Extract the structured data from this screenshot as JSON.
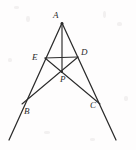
{
  "figure": {
    "background_color": "#fefdfd",
    "stroke_color": "#2b2b2b",
    "label_color": "#2b2b2b",
    "width": 136,
    "height": 150
  },
  "points": {
    "A": {
      "label": "A",
      "x": 62,
      "y": 23,
      "label_x": 53,
      "label_y": 11
    },
    "B": {
      "label": "B",
      "x": 22,
      "y": 104,
      "label_x": 24,
      "label_y": 107
    },
    "C": {
      "label": "C",
      "x": 100,
      "y": 104,
      "label_x": 90,
      "label_y": 101
    },
    "D": {
      "label": "D",
      "x": 78,
      "y": 57,
      "label_x": 81,
      "label_y": 48
    },
    "E": {
      "label": "E",
      "x": 45,
      "y": 58,
      "label_x": 32,
      "label_y": 53
    },
    "P": {
      "label": "P",
      "x": 62,
      "y": 72,
      "label_x": 60,
      "label_y": 75
    }
  },
  "segments": [
    {
      "name": "ray-A-through-B",
      "from": "A",
      "to": "B-extended",
      "x1": 62,
      "y1": 23,
      "x2": 9,
      "y2": 140
    },
    {
      "name": "ray-A-through-C",
      "from": "A",
      "to": "C-extended",
      "x1": 62,
      "y1": 23,
      "x2": 116,
      "y2": 140
    },
    {
      "name": "segment-A-P",
      "from": "A",
      "to": "P",
      "x1": 62,
      "y1": 23,
      "x2": 62,
      "y2": 72
    },
    {
      "name": "segment-E-C",
      "from": "E",
      "to": "C",
      "x1": 45,
      "y1": 58,
      "x2": 100,
      "y2": 104
    },
    {
      "name": "segment-D-B",
      "from": "D",
      "to": "B",
      "x1": 78,
      "y1": 57,
      "x2": 22,
      "y2": 104
    },
    {
      "name": "segment-E-D",
      "from": "E",
      "to": "D",
      "x1": 45,
      "y1": 58,
      "x2": 78,
      "y2": 57
    }
  ],
  "labels": {
    "A": "A",
    "B": "B",
    "C": "C",
    "D": "D",
    "E": "E",
    "P": "P"
  }
}
